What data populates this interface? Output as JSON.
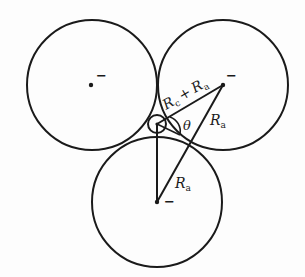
{
  "diagram": {
    "colors": {
      "stroke": "#1a1a1a",
      "background": "#fdfdfd"
    },
    "large_circles": [
      {
        "name": "left-anion",
        "cx": 92,
        "cy": 85,
        "r": 65,
        "charge": "−"
      },
      {
        "name": "right-anion",
        "cx": 223,
        "cy": 85,
        "r": 65,
        "charge": "−"
      },
      {
        "name": "bottom-anion",
        "cx": 157,
        "cy": 202,
        "r": 65,
        "charge": "−"
      }
    ],
    "small_circle": {
      "name": "cation",
      "cx": 157,
      "cy": 124,
      "r": 9
    },
    "labels": {
      "rc_plus_ra": {
        "r1": "R",
        "s1": "c",
        "plus": "+",
        "r2": "R",
        "s2": "a"
      },
      "theta": "θ",
      "ra_right": {
        "r": "R",
        "s": "a"
      },
      "ra_bottom": {
        "r": "R",
        "s": "a"
      },
      "charge_left": "−",
      "charge_right": "−",
      "charge_bottom": "−"
    }
  }
}
